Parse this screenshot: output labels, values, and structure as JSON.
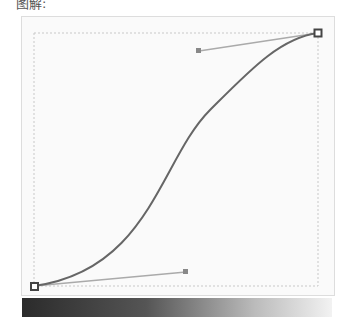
{
  "caption": "图解:",
  "curve": {
    "start": {
      "x": 34,
      "y": 286
    },
    "end": {
      "x": 318,
      "y": 33
    },
    "handle_start": {
      "x": 186,
      "y": 272
    },
    "handle_end": {
      "x": 199,
      "y": 51
    },
    "stroke_color": "#666666",
    "handle_line_color": "#aaaaaa"
  },
  "gradient": {
    "from": "#2b2b2b",
    "to": "#f2f2f2"
  }
}
